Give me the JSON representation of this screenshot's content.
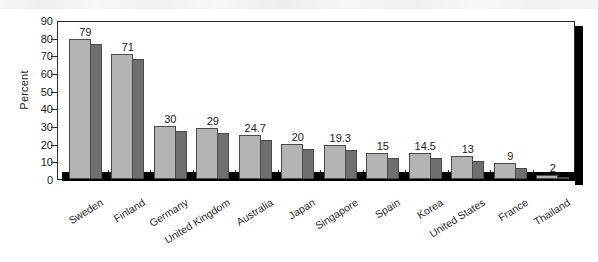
{
  "chart_data": {
    "type": "bar",
    "title": "",
    "subtitle": "",
    "xlabel": "",
    "ylabel": "Percent",
    "ylim": [
      0,
      90
    ],
    "ytick_step": 10,
    "yticks": [
      0,
      10,
      20,
      30,
      40,
      50,
      60,
      70,
      80,
      90
    ],
    "grid": false,
    "legend": "none",
    "bar_style": "3d-shaded",
    "data_labels": true,
    "categories": [
      "Sweden",
      "Finland",
      "Germany",
      "United Kingdom",
      "Australia",
      "Japan",
      "Singapore",
      "Spain",
      "Korea",
      "United States",
      "France",
      "Thailand"
    ],
    "values": [
      79,
      71,
      30,
      29,
      24.7,
      20,
      19.3,
      15,
      14.5,
      13,
      9,
      2
    ],
    "value_labels": [
      "79",
      "71",
      "30",
      "29",
      "24.7",
      "20",
      "19.3",
      "15",
      "14.5",
      "13",
      "9",
      "2"
    ],
    "series": [
      {
        "name": "Percent",
        "values": [
          79,
          71,
          30,
          29,
          24.7,
          20,
          19.3,
          15,
          14.5,
          13,
          9,
          2
        ]
      }
    ]
  },
  "colors": {
    "bar_front": "#b4b4b4",
    "bar_side": "#6f6f6f",
    "bar_outline": "#4a4a4a",
    "axis": "#2b2b2b",
    "shadow": "#000000",
    "background": "#ffffff",
    "text": "#1a1a1a"
  }
}
